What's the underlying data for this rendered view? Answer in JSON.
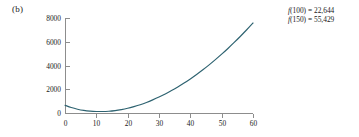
{
  "figure": {
    "panel_label": "(b)",
    "annotations": [
      {
        "fn": "f",
        "arg": "(100)",
        "eq": " = ",
        "value": "22,644"
      },
      {
        "fn": "f",
        "arg": "(150)",
        "eq": " = ",
        "value": "55,429"
      }
    ]
  },
  "chart_data": {
    "type": "line",
    "title": "",
    "xlabel": "",
    "ylabel": "",
    "xlim": [
      0,
      60
    ],
    "ylim": [
      0,
      8000
    ],
    "xticks": [
      0,
      10,
      20,
      30,
      40,
      50,
      60
    ],
    "yticks": [
      0,
      2000,
      4000,
      6000,
      8000
    ],
    "xtick_labels": [
      "0",
      "10",
      "20",
      "30",
      "40",
      "50",
      "60"
    ],
    "ytick_labels": [
      "0",
      "2000",
      "4000",
      "6000",
      "8000"
    ],
    "grid": false,
    "legend": null,
    "series": [
      {
        "name": "f(x)",
        "color": "#2d6270",
        "x": [
          0,
          2,
          4,
          6,
          8,
          10,
          12,
          14,
          16,
          18,
          20,
          22,
          24,
          26,
          28,
          30,
          32,
          34,
          36,
          38,
          40,
          42,
          44,
          46,
          48,
          50,
          52,
          54,
          56,
          58,
          60
        ],
        "values": [
          650,
          460,
          320,
          220,
          160,
          130,
          125,
          150,
          205,
          290,
          400,
          540,
          700,
          890,
          1105,
          1340,
          1600,
          1885,
          2190,
          2520,
          2870,
          3245,
          3640,
          4055,
          4495,
          4955,
          5435,
          5940,
          6465,
          7010,
          7580
        ]
      }
    ],
    "annotated_values": [
      {
        "x": 100,
        "y": 22644,
        "label": "f(100) = 22,644"
      },
      {
        "x": 150,
        "y": 55429,
        "label": "f(150) = 55,429"
      }
    ]
  },
  "geometry": {
    "plot_left": 65,
    "plot_right": 253,
    "plot_top": 18,
    "plot_bottom": 113
  }
}
